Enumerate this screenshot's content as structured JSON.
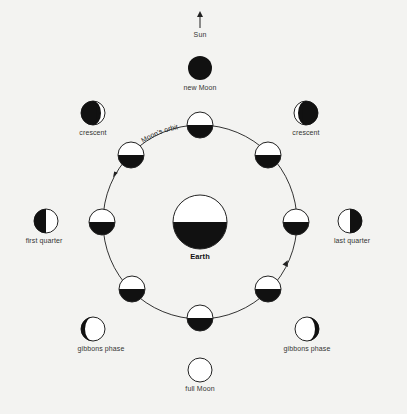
{
  "diagram": {
    "sun": {
      "label": "Sun",
      "icon": "up-arrow-icon"
    },
    "earth": {
      "label": "Earth"
    },
    "orbit": {
      "label": "Moon's orbit",
      "direction": "counter-clockwise"
    },
    "phases": [
      {
        "id": "new",
        "label": "new Moon"
      },
      {
        "id": "crescent-left",
        "label": "crescent"
      },
      {
        "id": "crescent-right",
        "label": "crescent"
      },
      {
        "id": "first-quarter",
        "label": "first quarter"
      },
      {
        "id": "last-quarter",
        "label": "last quarter"
      },
      {
        "id": "gibbous-left",
        "label": "gibbons phase"
      },
      {
        "id": "gibbous-right",
        "label": "gibbons phase"
      },
      {
        "id": "full",
        "label": "full Moon"
      }
    ],
    "orbit_positions": 8,
    "colors": {
      "background": "#f3f3f1",
      "ink": "#111111",
      "lit": "#ffffff"
    }
  }
}
